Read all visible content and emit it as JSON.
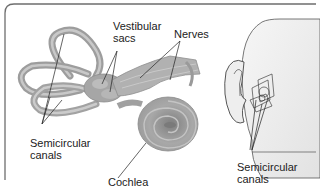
{
  "figure": {
    "labels": {
      "vestibular_sacs": [
        "Vestibular",
        "sacs"
      ],
      "nerves": "Nerves",
      "semicircular_canals_left": [
        "Semicircular",
        "canals"
      ],
      "cochlea": "Cochlea",
      "semicircular_canals_right": [
        "Semicircular",
        "canals"
      ]
    },
    "colors": {
      "border": "#6e6e6e",
      "structure_fill": "#a9a9a9",
      "structure_dark": "#8a8a8a",
      "structure_light": "#c4c4c4",
      "head_fill": "#ececec",
      "leader_line": "#222222"
    }
  }
}
